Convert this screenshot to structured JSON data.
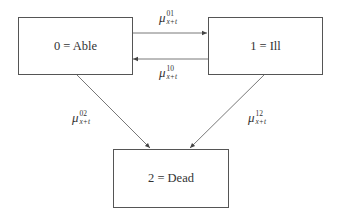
{
  "diagram": {
    "type": "multi-state transition diagram",
    "states": [
      {
        "id": "able",
        "label": "0 = Able"
      },
      {
        "id": "ill",
        "label": "1 = Ill"
      },
      {
        "id": "dead",
        "label": "2 = Dead"
      }
    ],
    "transitions": [
      {
        "id": "t01",
        "from": "able",
        "to": "ill",
        "symbol": "μ",
        "superscript": "01",
        "subscript": "x+t"
      },
      {
        "id": "t10",
        "from": "ill",
        "to": "able",
        "symbol": "μ",
        "superscript": "10",
        "subscript": "x+t"
      },
      {
        "id": "t02",
        "from": "able",
        "to": "dead",
        "symbol": "μ",
        "superscript": "02",
        "subscript": "x+t"
      },
      {
        "id": "t12",
        "from": "ill",
        "to": "dead",
        "symbol": "μ",
        "superscript": "12",
        "subscript": "x+t"
      }
    ],
    "colors": {
      "line": "#555555",
      "text": "#333333",
      "background": "#ffffff"
    }
  }
}
